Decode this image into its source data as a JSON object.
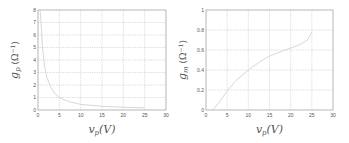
{
  "chart_data": [
    {
      "type": "line",
      "title": "",
      "xlabel": "v_p(V)",
      "ylabel": "g_p (Ω^-1)",
      "xlim": [
        0,
        30
      ],
      "ylim": [
        0,
        8
      ],
      "xticks": [
        0,
        5,
        10,
        15,
        20,
        25,
        30
      ],
      "yticks": [
        0,
        1,
        2,
        3,
        4,
        5,
        6,
        7,
        8
      ],
      "grid": true,
      "series": [
        {
          "name": "g_p",
          "x": [
            0.5,
            0.8,
            1,
            1.5,
            2,
            3,
            4,
            5,
            7,
            10,
            15,
            20,
            25
          ],
          "y": [
            8.0,
            6.5,
            5.2,
            3.6,
            2.7,
            1.8,
            1.3,
            1.0,
            0.7,
            0.45,
            0.3,
            0.22,
            0.18
          ]
        }
      ]
    },
    {
      "type": "line",
      "title": "",
      "xlabel": "v_p(V)",
      "ylabel": "g_m (Ω^-1)",
      "xlim": [
        0,
        30
      ],
      "ylim": [
        0,
        1
      ],
      "xticks": [
        0,
        5,
        10,
        15,
        20,
        25,
        30
      ],
      "yticks": [
        0,
        0.2,
        0.4,
        0.6,
        0.8,
        1
      ],
      "grid": true,
      "series": [
        {
          "name": "g_m",
          "x": [
            1.5,
            2,
            3,
            4,
            5,
            7,
            10,
            13,
            15,
            18,
            20,
            22,
            24,
            25
          ],
          "y": [
            0.0,
            0.02,
            0.07,
            0.13,
            0.19,
            0.29,
            0.4,
            0.49,
            0.54,
            0.59,
            0.62,
            0.65,
            0.7,
            0.78
          ]
        }
      ]
    }
  ],
  "labels": {
    "left": {
      "ylabel_main": "g",
      "ylabel_sub": "p",
      "ylabel_unit": "(Ω",
      "ylabel_exp": "−1",
      "ylabel_close": ")",
      "xlabel_main": "v",
      "xlabel_sub": "p",
      "xlabel_unit": "(V)"
    },
    "right": {
      "ylabel_main": "g",
      "ylabel_sub": "m",
      "ylabel_unit": "(Ω",
      "ylabel_exp": "−1",
      "ylabel_close": ")",
      "xlabel_main": "v",
      "xlabel_sub": "p",
      "xlabel_unit": "(V)"
    }
  },
  "colors": {
    "axis": "#888888",
    "grid": "#aaaaaa",
    "curve": "#d8d8d8",
    "text": "#555555"
  }
}
